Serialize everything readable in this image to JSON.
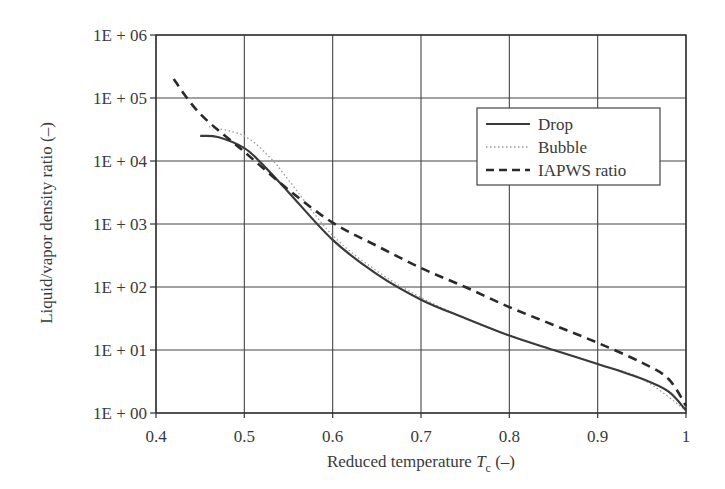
{
  "chart_data": {
    "type": "line",
    "title": "",
    "xlabel": "Reduced temperature T_c (–)",
    "xlabel_main": "Reduced temperature ",
    "xlabel_symbol": "T",
    "xlabel_sub": "c",
    "xlabel_unit": " (–)",
    "ylabel": "Liquid/vapor density ratio (–)",
    "yscale": "log",
    "xlim": [
      0.4,
      1.0
    ],
    "ylim": [
      1,
      1000000
    ],
    "grid": true,
    "legend_position": "upper right",
    "x_ticks": [
      "0.4",
      "0.5",
      "0.6",
      "0.7",
      "0.8",
      "0.9",
      "1"
    ],
    "x_tick_values": [
      0.4,
      0.5,
      0.6,
      0.7,
      0.8,
      0.9,
      1.0
    ],
    "y_ticks": [
      "1E + 00",
      "1E + 01",
      "1E + 02",
      "1E + 03",
      "1E + 04",
      "1E + 05",
      "1E + 06"
    ],
    "y_tick_values": [
      1,
      10,
      100,
      1000,
      10000,
      100000,
      1000000
    ],
    "series": [
      {
        "name": "Drop",
        "style": "solid",
        "color": "#3a3a3a",
        "x": [
          0.45,
          0.47,
          0.5,
          0.52,
          0.55,
          0.6,
          0.65,
          0.7,
          0.75,
          0.8,
          0.85,
          0.9,
          0.95,
          0.98,
          1.0
        ],
        "values": [
          25000,
          24000,
          16000,
          9000,
          3200,
          560,
          160,
          63,
          32,
          17,
          10,
          6,
          3.5,
          2.2,
          1.1
        ]
      },
      {
        "name": "Bubble",
        "style": "dotted",
        "color": "#9a9a9a",
        "x": [
          0.46,
          0.5,
          0.53,
          0.55,
          0.6,
          0.65,
          0.7,
          0.75,
          0.8,
          0.85,
          0.9,
          0.95,
          1.0
        ],
        "values": [
          35000,
          25000,
          11000,
          5000,
          660,
          180,
          68,
          32,
          17,
          10,
          6,
          3.5,
          1.1
        ]
      },
      {
        "name": "IAPWS ratio",
        "style": "dashed",
        "color": "#2a2a2a",
        "x": [
          0.42,
          0.45,
          0.5,
          0.55,
          0.6,
          0.65,
          0.7,
          0.75,
          0.8,
          0.85,
          0.9,
          0.95,
          0.98,
          1.0
        ],
        "values": [
          200000,
          56000,
          14000,
          3500,
          1050,
          450,
          200,
          100,
          48,
          25,
          13,
          6.3,
          3.5,
          1.3
        ]
      }
    ]
  }
}
